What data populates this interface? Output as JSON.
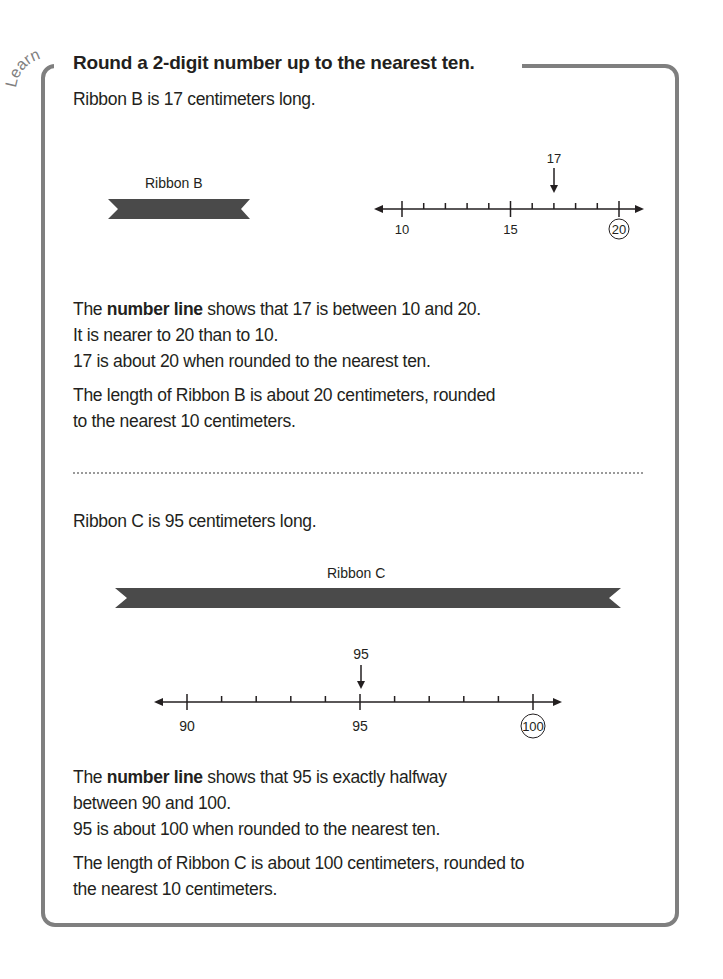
{
  "header": {
    "tag": "Learn",
    "title": "Round a 2-digit number up to the nearest ten."
  },
  "section_b": {
    "intro": "Ribbon B is 17 centimeters long.",
    "ribbon_label": "Ribbon B",
    "number_line": {
      "start": 10,
      "end": 20,
      "step": 1,
      "labels": [
        "10",
        "15",
        "20"
      ],
      "marked_value": "17",
      "circled_value": "20"
    },
    "explanation": {
      "line1_prefix": "The ",
      "line1_bold": "number line",
      "line1_suffix": " shows that 17 is between 10 and 20.",
      "line2": "It is nearer to 20 than to 10.",
      "line3": "17 is about 20 when rounded to the nearest ten."
    },
    "conclusion": {
      "line1": "The length of Ribbon B is about 20 centimeters, rounded",
      "line2": "to the nearest 10 centimeters."
    }
  },
  "section_c": {
    "intro": "Ribbon C is 95 centimeters long.",
    "ribbon_label": "Ribbon C",
    "number_line": {
      "start": 90,
      "end": 100,
      "step": 1,
      "labels": [
        "90",
        "95",
        "100"
      ],
      "marked_value": "95",
      "circled_value": "100"
    },
    "explanation": {
      "line1_prefix": "The ",
      "line1_bold": "number line",
      "line1_suffix": " shows that 95 is exactly halfway",
      "line2": "between 90 and 100.",
      "line3": "95 is about 100 when rounded to the nearest ten."
    },
    "conclusion": {
      "line1": "The length of Ribbon C is about 100 centimeters, rounded to",
      "line2": "the nearest 10 centimeters."
    }
  },
  "colors": {
    "border": "#7f7f7f",
    "ribbon": "#4a4a4a",
    "text": "#231f20"
  }
}
